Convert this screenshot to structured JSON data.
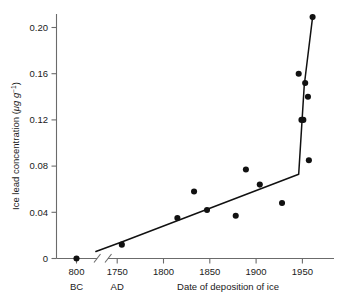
{
  "chart_data": {
    "type": "scatter",
    "title": "",
    "xlabel": "Date of deposition of ice",
    "ylabel": "Ice lead concentration (μg g⁻¹)",
    "ylabel_parts": {
      "main": "Ice lead concentration (",
      "unit_mu": "μg g",
      "unit_exp": "−1",
      "close": ")"
    },
    "era_left": "BC",
    "era_right": "AD",
    "xlim_left_segment": [
      820,
      780
    ],
    "xlim_right_segment": [
      1720,
      1968
    ],
    "ylim": [
      0,
      0.215
    ],
    "grid": false,
    "axis_break": true,
    "legend": "none",
    "ytick_labels": [
      "0",
      "0.04",
      "0.08",
      "0.12",
      "0.16",
      "0.20"
    ],
    "ytick_values": [
      0,
      0.04,
      0.08,
      0.12,
      0.16,
      0.2
    ],
    "xtick_labels_left": [
      "800"
    ],
    "xtick_values_left": [
      800
    ],
    "xtick_labels_right": [
      "1750",
      "1800",
      "1850",
      "1900",
      "1950"
    ],
    "xtick_values_right": [
      1750,
      1800,
      1850,
      1900,
      1950
    ],
    "points_left": [
      {
        "x": 800,
        "y": 0.0
      }
    ],
    "points_right": [
      {
        "x": 1755,
        "y": 0.012
      },
      {
        "x": 1815,
        "y": 0.035
      },
      {
        "x": 1833,
        "y": 0.058
      },
      {
        "x": 1847,
        "y": 0.042
      },
      {
        "x": 1878,
        "y": 0.037
      },
      {
        "x": 1889,
        "y": 0.077
      },
      {
        "x": 1904,
        "y": 0.064
      },
      {
        "x": 1928,
        "y": 0.048
      },
      {
        "x": 1946,
        "y": 0.16
      },
      {
        "x": 1949,
        "y": 0.12
      },
      {
        "x": 1951,
        "y": 0.12
      },
      {
        "x": 1953,
        "y": 0.152
      },
      {
        "x": 1956,
        "y": 0.14
      },
      {
        "x": 1957,
        "y": 0.085
      },
      {
        "x": 1961,
        "y": 0.209
      }
    ],
    "trend_line": [
      {
        "x": 1727,
        "y": 0.006
      },
      {
        "x": 1757,
        "y": 0.015
      },
      {
        "x": 1946,
        "y": 0.073
      },
      {
        "x": 1952,
        "y": 0.15
      },
      {
        "x": 1961,
        "y": 0.209
      }
    ],
    "marker_color": "#111111",
    "line_color": "#111111",
    "axis_color": "#6b6b6b",
    "background_color": "#ffffff"
  }
}
